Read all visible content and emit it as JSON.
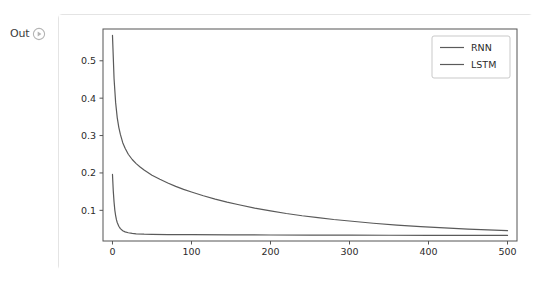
{
  "notebook": {
    "output_prompt_label": "Out",
    "run_icon_name": "run-circle-icon"
  },
  "figure": {
    "background": "#ffffff",
    "frame_color": "#555555",
    "tick_color": "#555555",
    "legend_border_color": "#c9c9c9",
    "legend_position": "upper right"
  },
  "chart_data": {
    "type": "line",
    "title": "",
    "xlabel": "",
    "ylabel": "",
    "xlim": [
      -12,
      512
    ],
    "ylim": [
      0.018,
      0.585
    ],
    "xticks": [
      0,
      100,
      200,
      300,
      400,
      500
    ],
    "xtick_labels": [
      "0",
      "100",
      "200",
      "300",
      "400",
      "500"
    ],
    "yticks": [
      0.1,
      0.2,
      0.3,
      0.4,
      0.5
    ],
    "ytick_labels": [
      "0.1",
      "0.2",
      "0.3",
      "0.4",
      "0.5"
    ],
    "grid": false,
    "legend": [
      "RNN",
      "LSTM"
    ],
    "series": [
      {
        "name": "RNN",
        "color": "#5a5a5a",
        "linewidth": 1.2,
        "x": [
          0,
          2,
          4,
          6,
          8,
          10,
          13,
          16,
          20,
          25,
          30,
          35,
          40,
          50,
          60,
          70,
          80,
          90,
          100,
          115,
          130,
          145,
          160,
          180,
          200,
          220,
          240,
          260,
          280,
          300,
          330,
          360,
          390,
          420,
          450,
          475,
          500
        ],
        "values": [
          0.568,
          0.452,
          0.388,
          0.348,
          0.322,
          0.303,
          0.281,
          0.266,
          0.25,
          0.236,
          0.225,
          0.216,
          0.208,
          0.194,
          0.183,
          0.173,
          0.164,
          0.156,
          0.149,
          0.139,
          0.13,
          0.122,
          0.115,
          0.106,
          0.0985,
          0.0915,
          0.0855,
          0.0805,
          0.0755,
          0.0715,
          0.0655,
          0.0605,
          0.0565,
          0.053,
          0.0495,
          0.0475,
          0.0455
        ]
      },
      {
        "name": "LSTM",
        "color": "#5a5a5a",
        "linewidth": 1.2,
        "x": [
          0,
          1,
          2,
          3,
          4,
          5,
          6,
          8,
          10,
          13,
          16,
          20,
          25,
          30,
          40,
          50,
          70,
          100,
          150,
          200,
          250,
          300,
          350,
          400,
          450,
          500
        ],
        "values": [
          0.196,
          0.152,
          0.122,
          0.1,
          0.086,
          0.075,
          0.0675,
          0.0575,
          0.051,
          0.0455,
          0.0425,
          0.04,
          0.0382,
          0.0372,
          0.0362,
          0.0357,
          0.0352,
          0.0348,
          0.0344,
          0.0341,
          0.0338,
          0.0336,
          0.0334,
          0.0332,
          0.033,
          0.0328
        ]
      }
    ]
  }
}
